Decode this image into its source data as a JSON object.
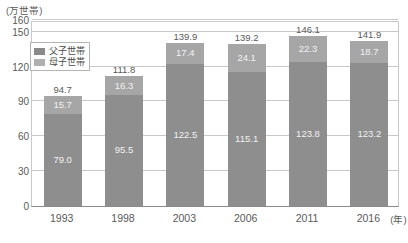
{
  "chart_data": {
    "type": "bar",
    "subtype": "stacked-bar",
    "title": "",
    "unit_label": "(万世帯)",
    "xlabel": "(年)",
    "ylabel": "",
    "categories": [
      "1993",
      "1998",
      "2003",
      "2006",
      "2011",
      "2016"
    ],
    "series": [
      {
        "name": "母子世帯",
        "color": "#8e8e8e",
        "values": [
          79.0,
          95.5,
          122.5,
          115.1,
          123.8,
          123.2
        ]
      },
      {
        "name": "父子世帯",
        "color": "#a6a6a6",
        "values": [
          15.7,
          16.3,
          17.4,
          24.1,
          22.3,
          18.7
        ]
      }
    ],
    "totals": [
      94.7,
      111.8,
      139.9,
      139.2,
      146.1,
      141.9
    ],
    "ylim": [
      0,
      160
    ],
    "yticks": [
      0,
      30,
      60,
      90,
      120,
      150,
      160
    ],
    "ytick_labels": [
      "0",
      "30",
      "60",
      "90",
      "120",
      "150",
      "160"
    ],
    "grid": true,
    "legend_position": "top-left"
  },
  "legend": {
    "items": [
      {
        "label": "父子世帯",
        "color": "#8a8a8a"
      },
      {
        "label": "母子世帯",
        "color": "#b0b0b0"
      }
    ]
  },
  "axis": {
    "unit_label": "(万世帯)",
    "x_unit": "(年)"
  }
}
